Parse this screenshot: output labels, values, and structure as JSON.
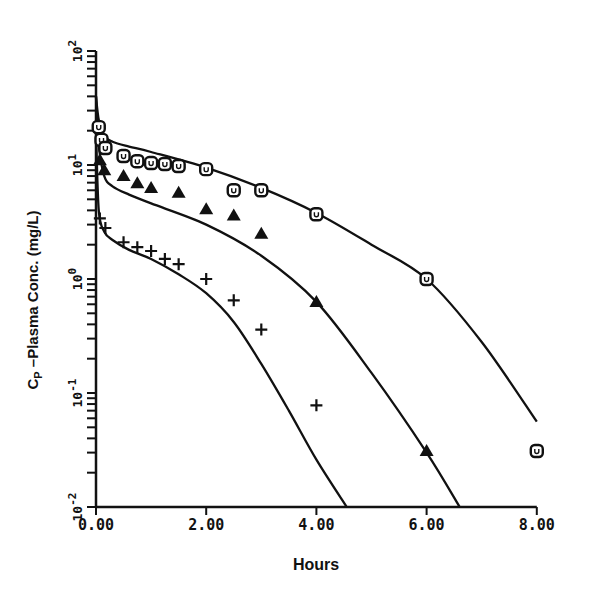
{
  "chart_data": {
    "type": "scatter",
    "title": "",
    "xlabel": "Hours",
    "ylabel": "CP –Plasma Conc. (mg/L)",
    "ylabel_main": "C",
    "ylabel_sub": "P",
    "ylabel_rest": " –Plasma Conc. (mg/L)",
    "xlim": [
      0,
      8
    ],
    "ylim": [
      0.01,
      100
    ],
    "yscale": "log",
    "grid": false,
    "legend": null,
    "x_ticks": [
      "0.00",
      "2.00",
      "4.00",
      "6.00",
      "8.00"
    ],
    "x_tick_values": [
      0,
      2,
      4,
      6,
      8
    ],
    "y_ticks": [
      "10^-2",
      "10^-1",
      "10^0",
      "10^1",
      "10^2"
    ],
    "y_tick_exponents": [
      -2,
      -1,
      0,
      1,
      2
    ],
    "series": [
      {
        "name": "circles (observed, high)",
        "marker": "circle",
        "x": [
          0.05,
          0.1,
          0.17,
          0.5,
          0.75,
          1.0,
          1.25,
          1.5,
          2.0,
          2.5,
          3.0,
          4.0,
          6.0,
          8.0
        ],
        "y": [
          21.5,
          16.6,
          14.1,
          12.0,
          10.8,
          10.4,
          10.2,
          9.8,
          9.2,
          6.0,
          6.0,
          3.7,
          1.0,
          0.031
        ]
      },
      {
        "name": "triangles (observed, middle)",
        "marker": "triangle",
        "x": [
          0.07,
          0.15,
          0.5,
          0.75,
          1.0,
          1.5,
          2.0,
          2.5,
          3.0,
          4.0,
          6.0
        ],
        "y": [
          11.0,
          9.0,
          8.0,
          6.9,
          6.3,
          5.7,
          4.1,
          3.6,
          2.5,
          0.63,
          0.031
        ]
      },
      {
        "name": "plus (observed, low)",
        "marker": "plus",
        "x": [
          0.07,
          0.17,
          0.5,
          0.75,
          1.0,
          1.25,
          1.5,
          2.0,
          2.5,
          3.0,
          4.0
        ],
        "y": [
          3.4,
          2.8,
          2.1,
          1.9,
          1.76,
          1.5,
          1.35,
          1.0,
          0.65,
          0.36,
          0.078
        ]
      },
      {
        "name": "fitted curve 1 (circles)",
        "marker": "line",
        "x": [
          0.0,
          0.05,
          0.15,
          0.3,
          0.6,
          1.0,
          2.0,
          3.0,
          4.0,
          5.0,
          6.0,
          7.0,
          8.0
        ],
        "y": [
          40,
          25,
          18,
          16,
          14.5,
          13,
          9.5,
          6.3,
          3.8,
          2.0,
          1.0,
          0.28,
          0.056
        ]
      },
      {
        "name": "fitted curve 2 (triangles)",
        "marker": "line",
        "x": [
          0.0,
          0.05,
          0.15,
          0.3,
          0.6,
          1.0,
          2.0,
          3.0,
          4.0,
          5.0,
          6.0,
          6.6
        ],
        "y": [
          40,
          15,
          8,
          6.5,
          5.5,
          4.6,
          3.0,
          1.6,
          0.63,
          0.15,
          0.03,
          0.01
        ]
      },
      {
        "name": "fitted curve 3 (plus)",
        "marker": "line",
        "x": [
          0.0,
          0.05,
          0.15,
          0.3,
          0.6,
          1.0,
          1.5,
          2.0,
          2.5,
          3.0,
          3.5,
          4.0,
          4.55
        ],
        "y": [
          20,
          4.0,
          2.6,
          2.2,
          1.8,
          1.5,
          1.1,
          0.75,
          0.42,
          0.18,
          0.07,
          0.026,
          0.01
        ]
      }
    ]
  },
  "axes": {
    "x_ticks": [
      "0.00",
      "2.00",
      "4.00",
      "6.00",
      "8.00"
    ],
    "y_tick_bases": [
      "10",
      "10",
      "10",
      "10",
      "10"
    ],
    "y_tick_exps": [
      "-2",
      "-1",
      "0",
      "1",
      "2"
    ]
  },
  "labels": {
    "xlabel": "Hours",
    "ylabel_main": "C",
    "ylabel_sub": "P",
    "ylabel_rest": " –Plasma Conc. (mg/L)"
  },
  "colors": {
    "ink": "#111111",
    "background": "#ffffff"
  }
}
